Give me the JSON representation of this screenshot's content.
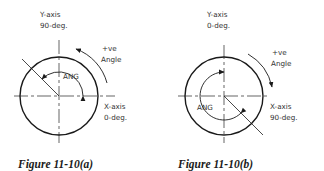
{
  "figures": [
    {
      "id": "a",
      "caption": "Figure 11-10(a)",
      "y_axis_label": "Y-axis",
      "y_axis_value": "90-deg.",
      "x_axis_label": "X-axis",
      "x_axis_value": "0-deg.",
      "direction_label_1": "+ve",
      "direction_label_2": "Angle",
      "angle_label": "ANG",
      "direction": "counter-clockwise"
    },
    {
      "id": "b",
      "caption": "Figure 11-10(b)",
      "y_axis_label": "Y-axis",
      "y_axis_value": "0-deg.",
      "x_axis_label": "X-axis",
      "x_axis_value": "90-deg.",
      "direction_label_1": "+ve",
      "direction_label_2": "Angle",
      "angle_label": "ANG",
      "direction": "clockwise"
    }
  ],
  "colors": {
    "line": "#1a1a1a",
    "text": "#333333"
  }
}
